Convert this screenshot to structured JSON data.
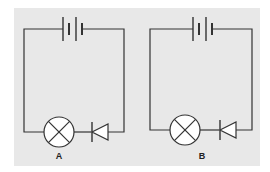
{
  "diagram": {
    "type": "circuit-comparison",
    "background_color": "#e8e8e8",
    "wire_color": "#333333",
    "circuits": [
      {
        "id": "A",
        "label": "A",
        "components": [
          "battery (two cells)",
          "lamp",
          "diode"
        ],
        "diode_orientation": "pointing left (toward lamp)"
      },
      {
        "id": "B",
        "label": "B",
        "components": [
          "battery (two cells)",
          "lamp",
          "diode"
        ],
        "diode_orientation": "pointing left (toward lamp)"
      }
    ]
  }
}
